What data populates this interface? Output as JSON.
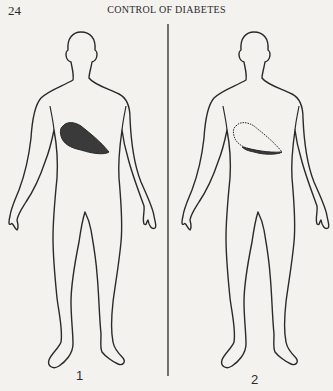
{
  "page": {
    "number": "24",
    "running_head": "CONTROL OF DIABETES"
  },
  "figures": [
    {
      "label": "1",
      "organ": "liver",
      "organ_style": "filled-dark"
    },
    {
      "label": "2",
      "organ": "liver",
      "organ_style": "outline-dotted-with-dark-lower-edge"
    }
  ],
  "colors": {
    "paper": "#f3f2ef",
    "ink": "#2a2a2a",
    "liver_fill": "#3a3a3a"
  }
}
